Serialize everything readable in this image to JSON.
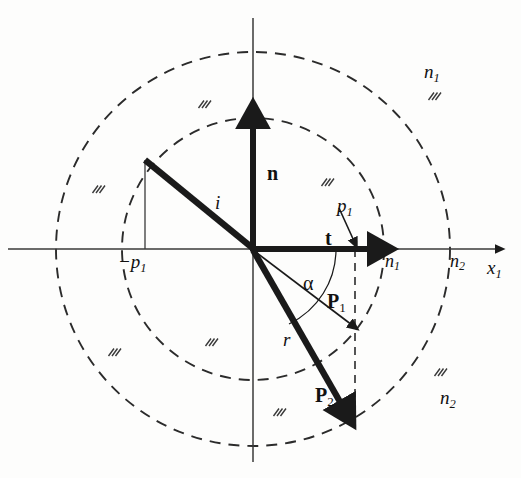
{
  "figure": {
    "domain": "vector diagram",
    "background_color": "#fdfdfc",
    "ink_color": "#1a1a1a"
  },
  "geometry": {
    "origin": {
      "x": 253,
      "y": 249
    },
    "inner_circle_radius": 131,
    "outer_circle_radius": 197,
    "p1_x": 355,
    "incident_start": {
      "x": 145,
      "y": 160
    },
    "minus_p1_x": 145,
    "n_tip": {
      "x": 253,
      "y": 118
    },
    "t_tip": {
      "x": 378,
      "y": 249
    },
    "r_tip": {
      "x": 345,
      "y": 412
    },
    "P1_tip": {
      "x": 355,
      "y": 330
    }
  },
  "axes": {
    "x_axis_label": "x",
    "x_axis_sub": "1",
    "x_axis_left": 8,
    "x_axis_right": 505,
    "y_axis_top": 18,
    "y_axis_bottom": 462
  },
  "circles": [
    {
      "name": "inner-interface-circle",
      "radius_label": "n",
      "radius_sub": "1",
      "style": "dashed"
    },
    {
      "name": "outer-interface-circle",
      "radius_label": "n",
      "radius_sub": "2",
      "style": "dashed"
    }
  ],
  "vectors": [
    {
      "name": "incident-ray",
      "label": "i",
      "sub": "",
      "weight": "thick",
      "arrow": false
    },
    {
      "name": "normal-vector",
      "label": "n",
      "sub": "",
      "weight": "thick",
      "arrow": true,
      "bold": true
    },
    {
      "name": "tangent-vector",
      "label": "t",
      "sub": "",
      "weight": "thick",
      "arrow": true,
      "bold": true
    },
    {
      "name": "refracted-ray",
      "label": "r",
      "sub": "",
      "weight": "thick",
      "arrow": true
    },
    {
      "name": "P1-vector",
      "label": "P",
      "sub": "1",
      "weight": "thin",
      "arrow": true,
      "bold": true
    },
    {
      "name": "P2-vector",
      "label": "P",
      "sub": "2",
      "weight": "thick",
      "arrow": true,
      "bold": true
    }
  ],
  "labels": {
    "n_vector": {
      "text": "n",
      "sub": "",
      "x": 267,
      "y": 163,
      "size": 20,
      "bold": true
    },
    "t_vector": {
      "text": "t",
      "sub": "",
      "x": 325,
      "y": 228,
      "size": 20,
      "bold": true
    },
    "i_ray": {
      "text": "i",
      "sub": "",
      "x": 215,
      "y": 193,
      "size": 19,
      "italic": true
    },
    "r_ray": {
      "text": "r",
      "sub": "",
      "x": 283,
      "y": 330,
      "size": 19,
      "italic": true
    },
    "alpha": {
      "text": "α",
      "sub": "",
      "x": 303,
      "y": 273,
      "size": 20
    },
    "P1": {
      "text": "P",
      "sub": "1",
      "x": 327,
      "y": 291,
      "size": 20,
      "bold": true
    },
    "P2": {
      "text": "P",
      "sub": "2",
      "x": 315,
      "y": 385,
      "size": 20,
      "bold": true
    },
    "p1_marker": {
      "text": "p",
      "sub": "1",
      "x": 337,
      "y": 196,
      "size": 19,
      "italic": true
    },
    "minus_p1": {
      "text": "−p",
      "sub": "1",
      "x": 118,
      "y": 252,
      "size": 19,
      "italic": true
    },
    "n1_axis": {
      "text": "n",
      "sub": "1",
      "x": 385,
      "y": 252,
      "size": 18,
      "italic": true
    },
    "n2_axis": {
      "text": "n",
      "sub": "2",
      "x": 450,
      "y": 252,
      "size": 18,
      "italic": true
    },
    "x1_axis": {
      "text": "x",
      "sub": "1",
      "x": 487,
      "y": 258,
      "size": 19,
      "italic": true
    },
    "n1_region": {
      "text": "n",
      "sub": "1",
      "x": 424,
      "y": 62,
      "size": 19,
      "italic": true
    },
    "n2_region": {
      "text": "n",
      "sub": "2",
      "x": 440,
      "y": 388,
      "size": 19,
      "italic": true
    }
  },
  "hatch_marks": [
    {
      "x": 198,
      "y": 100
    },
    {
      "x": 321,
      "y": 178
    },
    {
      "x": 428,
      "y": 92
    },
    {
      "x": 92,
      "y": 185
    },
    {
      "x": 205,
      "y": 338
    },
    {
      "x": 108,
      "y": 348
    },
    {
      "x": 273,
      "y": 408
    },
    {
      "x": 434,
      "y": 368
    }
  ]
}
